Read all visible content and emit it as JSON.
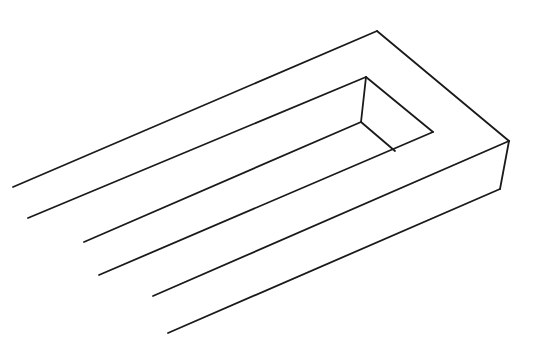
{
  "figure": {
    "title": "",
    "stroke_color": "#1a1a1a",
    "background": "#ffffff",
    "stroke_width": 1.8,
    "lines": [
      {
        "x1": 13,
        "y1": 187,
        "x2": 377,
        "y2": 31
      },
      {
        "x1": 377,
        "y1": 31,
        "x2": 509,
        "y2": 141
      },
      {
        "x1": 28,
        "y1": 218,
        "x2": 366,
        "y2": 77
      },
      {
        "x1": 366,
        "y1": 77,
        "x2": 433,
        "y2": 132
      },
      {
        "x1": 366,
        "y1": 77,
        "x2": 361,
        "y2": 122
      },
      {
        "x1": 361,
        "y1": 122,
        "x2": 395,
        "y2": 151
      },
      {
        "x1": 84,
        "y1": 242,
        "x2": 361,
        "y2": 122
      },
      {
        "x1": 99,
        "y1": 275,
        "x2": 433,
        "y2": 132
      },
      {
        "x1": 153,
        "y1": 296,
        "x2": 509,
        "y2": 141
      },
      {
        "x1": 509,
        "y1": 141,
        "x2": 500,
        "y2": 189
      },
      {
        "x1": 168,
        "y1": 333,
        "x2": 500,
        "y2": 189
      }
    ]
  }
}
